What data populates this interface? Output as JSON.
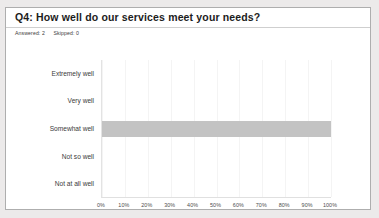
{
  "card": {
    "question_title": "Q4:  How well do our services meet your needs?",
    "meta": {
      "answered_label": "Answered:",
      "answered_value": "2",
      "skipped_label": "Skipped:",
      "skipped_value": "0"
    }
  },
  "colors": {
    "bar": "#c3c3c3",
    "card_border": "#aeaeae",
    "page_background": "#eceaea",
    "gridline": "#f4f4f4",
    "title_text": "#1c1c1c"
  },
  "chart_data": {
    "type": "bar",
    "orientation": "horizontal",
    "title": "Q4:  How well do our services meet your needs?",
    "xlabel": "",
    "ylabel": "",
    "categories": [
      "Extremely well",
      "Very well",
      "Somewhat well",
      "Not so well",
      "Not at all well"
    ],
    "values": [
      0,
      0,
      100,
      0,
      0
    ],
    "value_unit": "%",
    "xlim": [
      0,
      100
    ],
    "xticks": [
      0,
      10,
      20,
      30,
      40,
      50,
      60,
      70,
      80,
      90,
      100
    ],
    "xtick_labels": [
      "0%",
      "10%",
      "20%",
      "30%",
      "40%",
      "50%",
      "60%",
      "70%",
      "80%",
      "90%",
      "100%"
    ],
    "grid": true,
    "grid_axis": "x",
    "legend": false,
    "series": [
      {
        "name": "Responses",
        "color": "#c3c3c3",
        "values": [
          0,
          0,
          100,
          0,
          0
        ]
      }
    ]
  }
}
